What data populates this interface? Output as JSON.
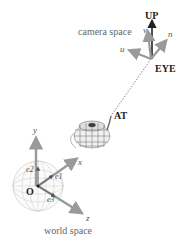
{
  "diagram": {
    "camera": {
      "space_label": "camera space",
      "up_label": "UP",
      "eye_label": "EYE",
      "axes": {
        "u": "u",
        "v": "v",
        "n": "n"
      }
    },
    "target": {
      "at_label": "AT"
    },
    "world": {
      "space_label": "world space",
      "origin_label": "O",
      "axes": {
        "x": "x",
        "y": "y",
        "z": "z"
      },
      "basis": {
        "e1": "e1",
        "e2": "e2",
        "e3": "e3"
      }
    },
    "colors": {
      "axis_gray": "#9a9a9a",
      "dark": "#222222",
      "mesh": "#6a6a6a"
    }
  }
}
